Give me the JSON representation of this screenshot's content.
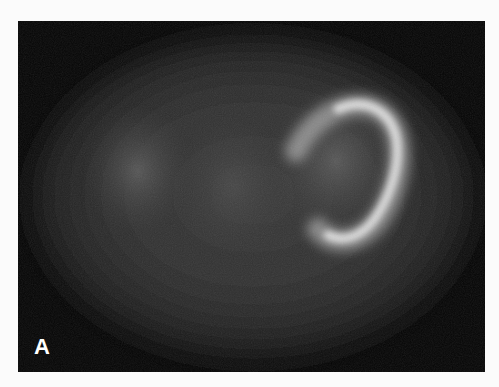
{
  "figure": {
    "panel_label": "A",
    "image_description": "Grayscale nuclear scintigraphy (cardiac scan) with a bright horseshoe-shaped uptake on the upper right inside an elliptical body outline",
    "colors": {
      "frame_background": "#050505",
      "page_background": "#fbfbfb",
      "label_color": "#ffffff"
    }
  }
}
